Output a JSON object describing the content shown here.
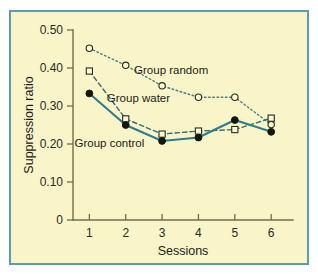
{
  "figure": {
    "background_color": "#f9f5c9",
    "border_color": "#5d9cab",
    "page_color": "#ffffff"
  },
  "chart_data": {
    "type": "line",
    "title": "",
    "subtitle": "",
    "xlabel": "Sessions",
    "ylabel": "Suppression ratio",
    "x": [
      1,
      2,
      3,
      4,
      5,
      6
    ],
    "xtick_labels": [
      "1",
      "2",
      "3",
      "4",
      "5",
      "6"
    ],
    "ytick_labels": [
      "0",
      "0.10",
      "0.20",
      "0.30",
      "0.40",
      "0.50"
    ],
    "ytick_values": [
      0,
      0.1,
      0.2,
      0.3,
      0.4,
      0.5
    ],
    "xlim": [
      0.55,
      6.6
    ],
    "ylim": [
      0,
      0.5
    ],
    "grid": false,
    "legend": "inline-annotations",
    "series": [
      {
        "name": "Group random",
        "label": "Group random",
        "values": [
          0.452,
          0.407,
          0.353,
          0.323,
          0.323,
          0.251
        ],
        "marker": "open-circle",
        "line_style": "dotted",
        "color": "#4a7f8c",
        "label_x": 3.25,
        "label_y": 0.385
      },
      {
        "name": "Group water",
        "label": "Group water",
        "values": [
          0.392,
          0.266,
          0.226,
          0.234,
          0.238,
          0.268
        ],
        "marker": "open-square",
        "line_style": "dashed",
        "color": "#3a6b76",
        "label_x": 2.35,
        "label_y": 0.31
      },
      {
        "name": "Group control",
        "label": "Group control",
        "values": [
          0.333,
          0.25,
          0.208,
          0.217,
          0.263,
          0.232
        ],
        "marker": "filled-circle",
        "line_style": "solid",
        "color": "#2f7c8c",
        "label_x": 1.55,
        "label_y": 0.192
      }
    ]
  }
}
